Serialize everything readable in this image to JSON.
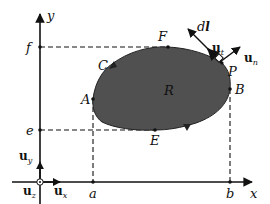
{
  "diagram": {
    "colors": {
      "region_fill": "#505050",
      "line": "#111111",
      "background": "#ffffff"
    },
    "axes": {
      "x_label": "x",
      "y_label": "y",
      "x_ticks": [
        "a",
        "b"
      ],
      "y_ticks": [
        "f",
        "e"
      ]
    },
    "region": {
      "label": "R",
      "points": [
        "A",
        "C",
        "F",
        "P",
        "B",
        "E"
      ]
    },
    "point_labels": {
      "A": "A",
      "B": "B",
      "C": "C",
      "E": "E",
      "F": "F",
      "P": "P",
      "R": "R",
      "a": "a",
      "b": "b",
      "e": "e",
      "f": "f",
      "x": "x",
      "y": "y"
    },
    "vectors": {
      "dl": {
        "main": "d",
        "bold": "l"
      },
      "ut": {
        "main": "u",
        "sub": "t"
      },
      "un": {
        "main": "u",
        "sub": "n"
      },
      "ux": {
        "main": "u",
        "sub": "x"
      },
      "uy": {
        "main": "u",
        "sub": "y"
      },
      "uz": {
        "main": "u",
        "sub": "z"
      }
    }
  }
}
